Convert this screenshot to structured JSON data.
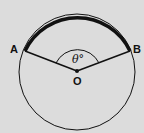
{
  "diagram": {
    "labels": {
      "A": "A",
      "B": "B",
      "O": "O",
      "angle": "θ°"
    },
    "colors": {
      "background": "#dcdcdc",
      "stroke": "#111111"
    }
  }
}
